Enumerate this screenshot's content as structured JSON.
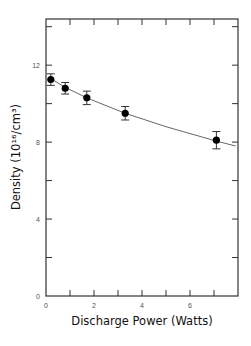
{
  "chart_data": {
    "type": "scatter",
    "title": "",
    "xlabel": "Discharge Power (Watts)",
    "ylabel": "Density (10¹⁶/cm³)",
    "ylabel_parts": {
      "main": "Density",
      "unit": "(10¹⁶/cm³)"
    },
    "xlim": [
      0,
      8
    ],
    "ylim": [
      0,
      14.4
    ],
    "x_ticks": [
      0,
      1,
      2,
      3,
      4,
      5,
      6,
      7
    ],
    "x_tick_labels": [
      "0",
      "",
      "2",
      "",
      "4",
      "",
      "6",
      ""
    ],
    "y_ticks": [
      0,
      2,
      4,
      6,
      8,
      10,
      12,
      14
    ],
    "y_tick_labels": [
      "0",
      "",
      "4",
      "",
      "8",
      "",
      "12",
      ""
    ],
    "grid": false,
    "legend": null,
    "series": [
      {
        "name": "Measured density",
        "marker": "filled-circle",
        "x": [
          0.2,
          0.8,
          1.7,
          3.3,
          7.1
        ],
        "y": [
          11.25,
          10.8,
          10.3,
          9.5,
          8.1
        ],
        "y_error": [
          0.3,
          0.3,
          0.35,
          0.35,
          0.45
        ]
      },
      {
        "name": "Fit curve",
        "style": "thin-line",
        "x": [
          0.2,
          0.8,
          1.7,
          3.3,
          5.0,
          7.1,
          7.9
        ],
        "y": [
          11.3,
          10.85,
          10.3,
          9.5,
          8.8,
          8.05,
          7.8
        ]
      }
    ]
  }
}
